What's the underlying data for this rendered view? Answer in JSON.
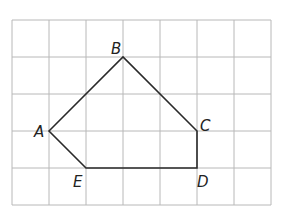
{
  "diagram": {
    "type": "polygon-on-grid",
    "grid": {
      "columns": 7,
      "rows": 5,
      "cell_px": 37,
      "origin_x": 12,
      "origin_y": 20,
      "line_color": "#b8b8b8"
    },
    "polygon": {
      "stroke": "#2a2a2a",
      "vertices": [
        "A",
        "B",
        "C",
        "D",
        "E"
      ]
    },
    "points": {
      "A": {
        "label": "A",
        "gx": 1,
        "gy": 3
      },
      "B": {
        "label": "B",
        "gx": 3,
        "gy": 1
      },
      "C": {
        "label": "C",
        "gx": 5,
        "gy": 3
      },
      "D": {
        "label": "D",
        "gx": 5,
        "gy": 4
      },
      "E": {
        "label": "E",
        "gx": 2,
        "gy": 4
      }
    }
  }
}
